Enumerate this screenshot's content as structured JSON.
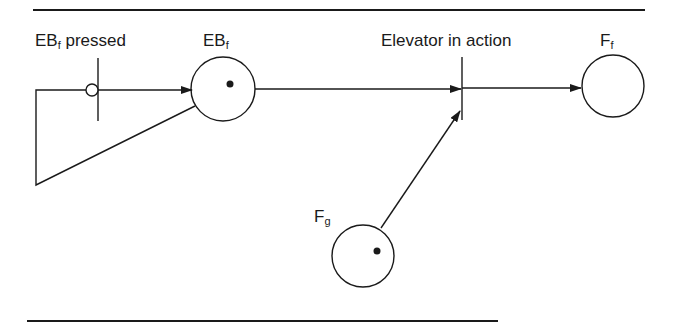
{
  "diagram": {
    "type": "petri-net",
    "labels": {
      "transition_pressed": {
        "main": "EB",
        "sub": "f",
        "suffix": " pressed"
      },
      "place_ebf": {
        "main": "EB",
        "sub": "f"
      },
      "transition_elevator": "Elevator in action",
      "place_ff": {
        "main": "F",
        "sub": "f"
      },
      "place_fg": {
        "main": "F",
        "sub": "g"
      }
    },
    "places": [
      {
        "id": "EBf",
        "tokens": 1
      },
      {
        "id": "Ff",
        "tokens": 0
      },
      {
        "id": "Fg",
        "tokens": 1
      }
    ],
    "transitions": [
      {
        "id": "EBf pressed",
        "inhibitor_input_from": "EBf",
        "output_to": "EBf"
      },
      {
        "id": "Elevator in action",
        "inputs": [
          "EBf",
          "Fg"
        ],
        "outputs": [
          "Ff"
        ]
      }
    ],
    "colors": {
      "ink": "#1a1a1a",
      "background": "#ffffff"
    }
  }
}
